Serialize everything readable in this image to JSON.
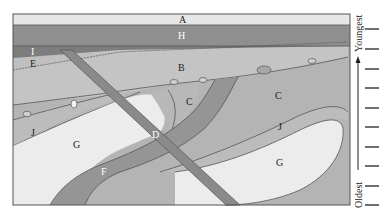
{
  "diagram": {
    "type": "geologic-cross-section",
    "units": [
      {
        "id": "A",
        "label": "A",
        "description": "top horizontal layer",
        "color": "#e6e6e6"
      },
      {
        "id": "H",
        "label": "H",
        "description": "horizontal dark layer",
        "color": "#8f8f8f"
      },
      {
        "id": "I",
        "label": "I",
        "description": "thin dark layer / sill on left",
        "color": "#7d7d7d"
      },
      {
        "id": "E",
        "label": "E",
        "description": "tilted layer below I",
        "color": "#b9b9b9"
      },
      {
        "id": "B",
        "label": "B",
        "description": "layer above unconformity",
        "color": "#c4c4c4"
      },
      {
        "id": "C",
        "label": "C",
        "description": "folded layer",
        "color": "#b4b4b4"
      },
      {
        "id": "D",
        "label": "D",
        "description": "diagonal dike crossing section",
        "color": "#8a8a8a"
      },
      {
        "id": "F",
        "label": "F",
        "description": "curved intrusion band",
        "color": "#959595"
      },
      {
        "id": "G",
        "label": "G",
        "description": "light core bodies",
        "color": "#ececec"
      },
      {
        "id": "J",
        "label": "J",
        "description": "folded layer around G",
        "color": "#bcbcbc"
      }
    ],
    "labels": {
      "A": "A",
      "H": "H",
      "I": "I",
      "E": "E",
      "B": "B",
      "C1": "C",
      "C2": "C",
      "D": "D",
      "F": "F",
      "G1": "G",
      "G2": "G",
      "J1": "J",
      "J2": "J"
    },
    "colors": {
      "outline": "#555555",
      "background": "#ffffff"
    }
  },
  "age_scale": {
    "top_label": "Youngest",
    "bottom_label": "Oldest",
    "tick_count": 10
  }
}
